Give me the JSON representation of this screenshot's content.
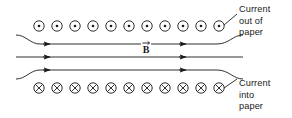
{
  "figure": {
    "type": "physics-field-diagram",
    "background_color": "#ffffff",
    "stroke_color": "#1a1a1a"
  },
  "top_row": {
    "symbol_name": "current-out-of-page-dot",
    "symbol_glyph": "circle-with-center-dot",
    "count": 11,
    "x_positions": [
      39,
      57,
      75,
      93,
      111,
      129,
      147,
      165,
      183,
      201,
      219
    ],
    "y": 26,
    "radius": 5.2,
    "dot_radius": 1.3
  },
  "bottom_row": {
    "symbol_name": "current-into-page-cross",
    "symbol_glyph": "circle-with-x",
    "count": 11,
    "x_positions": [
      39,
      57,
      75,
      93,
      111,
      129,
      147,
      165,
      183,
      201,
      219
    ],
    "y": 88,
    "radius": 5.2
  },
  "field_lines": [
    {
      "name": "field-line-top",
      "y": 44,
      "direction": "right",
      "curved_ends": true,
      "arrow_x": 50
    },
    {
      "name": "field-line-middle",
      "y": 57,
      "direction": "right",
      "curved_ends": false,
      "arrow_x": 50
    },
    {
      "name": "field-line-bottom",
      "y": 70,
      "direction": "right",
      "curved_ends": true,
      "arrow_x": 50
    }
  ],
  "b_field_label": {
    "name": "magnetic-field-vector-label",
    "text": "B",
    "vector_arrow": true,
    "x": 146,
    "y": 51
  },
  "annotations": {
    "current_out": {
      "name": "current-out-of-paper-label",
      "lines": [
        "Current",
        "out of",
        "paper"
      ],
      "leader_from": [
        224,
        25
      ],
      "leader_to": [
        237,
        14
      ]
    },
    "current_into": {
      "name": "current-into-paper-label",
      "lines": [
        "Current",
        "into",
        "paper"
      ],
      "leader_from": [
        224,
        88
      ],
      "leader_to": [
        237,
        79
      ]
    }
  }
}
